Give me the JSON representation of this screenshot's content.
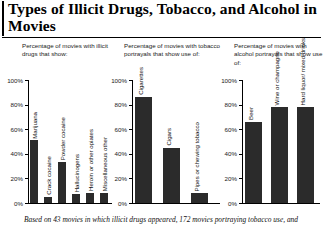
{
  "title": "Types of Illicit Drugs, Tobacco, and Alcohol in Movies",
  "footnote": "Based on 43 movies in which illicit drugs appeared, 172 movies portraying tobacco use, and",
  "colors": {
    "bar": "#2b2b2b",
    "axis": "#000000",
    "background": "#ffffff",
    "text": "#000000"
  },
  "panels": [
    {
      "subtitle": "Percentage of movies with illicit drugs that show:",
      "tick_labels": [
        "100%",
        "80%",
        "60%",
        "40%",
        "20%",
        "0%"
      ]
    },
    {
      "subtitle": "Percentage of movies with tobacco portrayals that show use of:",
      "tick_labels": [
        "100%",
        "80%",
        "60%",
        "40%",
        "20%",
        "0%"
      ]
    },
    {
      "subtitle": "Percentage of movies with alcohol portrayals that show use of:",
      "tick_labels": [
        "100%",
        "80%",
        "60%",
        "40%",
        "20%",
        "0%"
      ]
    }
  ],
  "chart_data": [
    {
      "type": "bar",
      "title": "Percentage of movies with illicit drugs that show:",
      "categories": [
        "Marijuana",
        "Crack cocaine",
        "Powder cocaine",
        "Hallucinogens",
        "Heroin or other opiates",
        "Miscellaneous other"
      ],
      "values": [
        51,
        5,
        33,
        7,
        8,
        8
      ],
      "xlabel": "",
      "ylabel": "",
      "ylim": [
        0,
        100
      ],
      "yticks": [
        0,
        20,
        40,
        60,
        80,
        100
      ],
      "ytick_labels": [
        "0%",
        "20%",
        "40%",
        "60%",
        "80%",
        "100%"
      ],
      "grid": false,
      "legend": "none"
    },
    {
      "type": "bar",
      "title": "Percentage of movies with tobacco portrayals that show use of:",
      "categories": [
        "Cigarettes",
        "Cigars",
        "Pipes or chewing tobacco"
      ],
      "values": [
        86,
        45,
        8
      ],
      "xlabel": "",
      "ylabel": "",
      "ylim": [
        0,
        100
      ],
      "yticks": [
        0,
        20,
        40,
        60,
        80,
        100
      ],
      "ytick_labels": [
        "0%",
        "20%",
        "40%",
        "60%",
        "80%",
        "100%"
      ],
      "grid": false,
      "legend": "none"
    },
    {
      "type": "bar",
      "title": "Percentage of movies with alcohol portrayals that show use of:",
      "categories": [
        "Beer",
        "Wine or champagne",
        "Hard liquor/ mixed drinks"
      ],
      "values": [
        66,
        78,
        78
      ],
      "xlabel": "",
      "ylabel": "",
      "ylim": [
        0,
        100
      ],
      "yticks": [
        0,
        20,
        40,
        60,
        80,
        100
      ],
      "ytick_labels": [
        "0%",
        "20%",
        "40%",
        "60%",
        "80%",
        "100%"
      ],
      "grid": false,
      "legend": "none"
    }
  ]
}
